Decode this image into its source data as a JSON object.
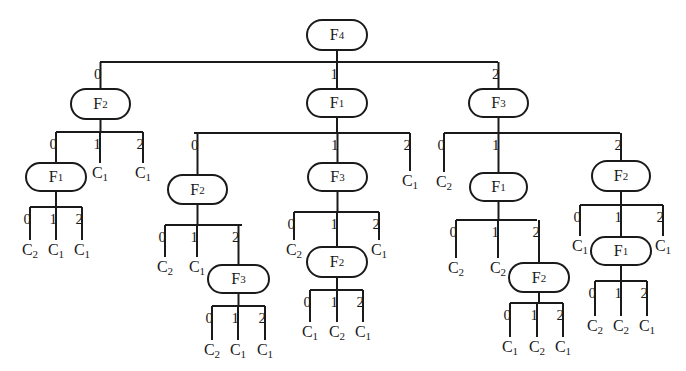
{
  "diagram": {
    "type": "decision-tree",
    "root": {
      "id": "n_root",
      "label": "F",
      "sub": "4",
      "x": 306,
      "y": 19,
      "w": 62,
      "h": 32,
      "bar": {
        "y": 62,
        "x1": 100,
        "x2": 498
      },
      "children": [
        {
          "edge": "0",
          "id": "n_a",
          "label": "F",
          "sub": "2",
          "x": 70,
          "y": 88,
          "w": 61,
          "h": 32,
          "bar": {
            "y": 132,
            "x1": 56,
            "x2": 143
          },
          "children": [
            {
              "edge": "0",
              "id": "n_a0",
              "label": "F",
              "sub": "1",
              "x": 25,
              "y": 162,
              "w": 62,
              "h": 30,
              "bar": {
                "y": 207,
                "x1": 30,
                "x2": 82
              },
              "children": [
                {
                  "edge": "0",
                  "leaf": "C",
                  "sub": "2",
                  "lx": 30,
                  "ly": 240
                },
                {
                  "edge": "1",
                  "leaf": "C",
                  "sub": "1",
                  "lx": 56,
                  "ly": 240
                },
                {
                  "edge": "2",
                  "leaf": "C",
                  "sub": "1",
                  "lx": 82,
                  "ly": 240
                }
              ]
            },
            {
              "edge": "1",
              "leaf": "C",
              "sub": "1",
              "lx": 100,
              "ly": 163
            },
            {
              "edge": "2",
              "leaf": "C",
              "sub": "1",
              "lx": 143,
              "ly": 163
            }
          ]
        },
        {
          "edge": "1",
          "id": "n_b",
          "label": "F",
          "sub": "1",
          "x": 306,
          "y": 88,
          "w": 62,
          "h": 30,
          "bar": {
            "y": 133,
            "x1": 194,
            "x2": 410
          },
          "children": [
            {
              "edge": "0",
              "id": "n_b0",
              "label": "F",
              "sub": "2",
              "x": 167,
              "y": 174,
              "w": 61,
              "h": 31,
              "bar": {
                "y": 225,
                "x1": 165,
                "x2": 242
              },
              "children": [
                {
                  "edge": "0",
                  "leaf": "C",
                  "sub": "2",
                  "lx": 165,
                  "ly": 257
                },
                {
                  "edge": "1",
                  "leaf": "C",
                  "sub": "1",
                  "lx": 197,
                  "ly": 257
                },
                {
                  "edge": "2",
                  "id": "n_b02",
                  "label": "F",
                  "sub": "3",
                  "x": 207,
                  "y": 264,
                  "w": 63,
                  "h": 30,
                  "bar": {
                    "y": 306,
                    "x1": 212,
                    "x2": 265
                  },
                  "children": [
                    {
                      "edge": "0",
                      "leaf": "C",
                      "sub": "2",
                      "lx": 212,
                      "ly": 340
                    },
                    {
                      "edge": "1",
                      "leaf": "C",
                      "sub": "1",
                      "lx": 238,
                      "ly": 340
                    },
                    {
                      "edge": "2",
                      "leaf": "C",
                      "sub": "1",
                      "lx": 265,
                      "ly": 340
                    }
                  ]
                }
              ]
            },
            {
              "edge": "1",
              "id": "n_b1",
              "label": "F",
              "sub": "3",
              "x": 307,
              "y": 162,
              "w": 61,
              "h": 30,
              "bar": {
                "y": 212,
                "x1": 294,
                "x2": 379
              },
              "children": [
                {
                  "edge": "0",
                  "leaf": "C",
                  "sub": "2",
                  "lx": 294,
                  "ly": 240
                },
                {
                  "edge": "1",
                  "id": "n_b11",
                  "label": "F",
                  "sub": "2",
                  "x": 306,
                  "y": 246,
                  "w": 62,
                  "h": 32,
                  "bar": {
                    "y": 290,
                    "x1": 310,
                    "x2": 363
                  },
                  "children": [
                    {
                      "edge": "0",
                      "leaf": "C",
                      "sub": "1",
                      "lx": 310,
                      "ly": 322
                    },
                    {
                      "edge": "1",
                      "leaf": "C",
                      "sub": "2",
                      "lx": 337,
                      "ly": 322
                    },
                    {
                      "edge": "2",
                      "leaf": "C",
                      "sub": "1",
                      "lx": 363,
                      "ly": 322
                    }
                  ]
                },
                {
                  "edge": "2",
                  "leaf": "C",
                  "sub": "1",
                  "lx": 379,
                  "ly": 240
                }
              ]
            },
            {
              "edge": "2",
              "leaf": "C",
              "sub": "1",
              "lx": 410,
              "ly": 171
            }
          ]
        },
        {
          "edge": "2",
          "id": "n_c",
          "label": "F",
          "sub": "3",
          "x": 468,
          "y": 88,
          "w": 61,
          "h": 30,
          "bar": {
            "y": 133,
            "x1": 444,
            "x2": 620
          },
          "children": [
            {
              "edge": "0",
              "leaf": "C",
              "sub": "2",
              "lx": 444,
              "ly": 172
            },
            {
              "edge": "1",
              "id": "n_c1",
              "label": "F",
              "sub": "1",
              "x": 469,
              "y": 172,
              "w": 59,
              "h": 30,
              "bar": {
                "y": 220,
                "x1": 456,
                "x2": 537
              },
              "children": [
                {
                  "edge": "0",
                  "leaf": "C",
                  "sub": "2",
                  "lx": 456,
                  "ly": 258
                },
                {
                  "edge": "1",
                  "leaf": "C",
                  "sub": "2",
                  "lx": 498,
                  "ly": 258
                },
                {
                  "edge": "2",
                  "id": "n_c12",
                  "label": "F",
                  "sub": "2",
                  "x": 508,
                  "y": 262,
                  "w": 62,
                  "h": 31,
                  "bar": {
                    "y": 303,
                    "x1": 510,
                    "x2": 563
                  },
                  "children": [
                    {
                      "edge": "0",
                      "leaf": "C",
                      "sub": "1",
                      "lx": 510,
                      "ly": 337
                    },
                    {
                      "edge": "1",
                      "leaf": "C",
                      "sub": "2",
                      "lx": 537,
                      "ly": 337
                    },
                    {
                      "edge": "2",
                      "leaf": "C",
                      "sub": "1",
                      "lx": 563,
                      "ly": 337
                    }
                  ]
                }
              ]
            },
            {
              "edge": "2",
              "id": "n_c2",
              "label": "F",
              "sub": "2",
              "x": 591,
              "y": 160,
              "w": 60,
              "h": 32,
              "bar": {
                "y": 205,
                "x1": 580,
                "x2": 663
              },
              "children": [
                {
                  "edge": "0",
                  "leaf": "C",
                  "sub": "1",
                  "lx": 580,
                  "ly": 236
                },
                {
                  "edge": "1",
                  "id": "n_c21",
                  "label": "F",
                  "sub": "1",
                  "x": 590,
                  "y": 236,
                  "w": 62,
                  "h": 30,
                  "bar": {
                    "y": 281,
                    "x1": 595,
                    "x2": 647
                  },
                  "children": [
                    {
                      "edge": "0",
                      "leaf": "C",
                      "sub": "2",
                      "lx": 595,
                      "ly": 316
                    },
                    {
                      "edge": "1",
                      "leaf": "C",
                      "sub": "2",
                      "lx": 621,
                      "ly": 316
                    },
                    {
                      "edge": "2",
                      "leaf": "C",
                      "sub": "1",
                      "lx": 647,
                      "ly": 316
                    }
                  ]
                },
                {
                  "edge": "2",
                  "leaf": "C",
                  "sub": "1",
                  "lx": 663,
                  "ly": 236
                }
              ]
            }
          ]
        }
      ]
    }
  },
  "colors": {
    "line": "#1a1a1a",
    "background": "#ffffff"
  }
}
